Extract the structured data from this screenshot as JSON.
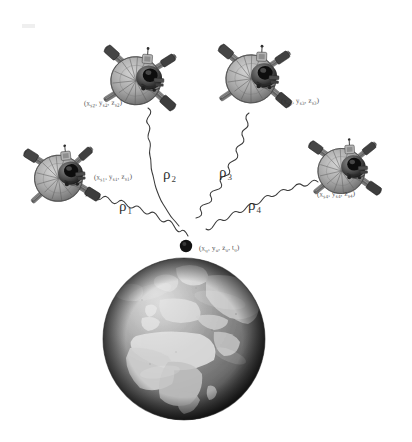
{
  "figure": {
    "background_color": "#ffffff",
    "width": 412,
    "height": 442
  },
  "earth": {
    "name": "Earth globe",
    "description": "Grayscale rendered globe showing Europe and Africa",
    "center_x": 184,
    "center_y": 339,
    "radius": 81,
    "ocean_color": "#8f8f8f",
    "land_color": "#d8d8d8",
    "shadow_color": "#2a2a2a"
  },
  "satellites": [
    {
      "id": "sv1",
      "name": "satellite-1",
      "label": "(xₛ₁, yₛ₁, zₛ₁)",
      "label_parts": [
        "x",
        "s1",
        "y",
        "s1",
        "z",
        "s1"
      ],
      "x": 62,
      "y": 175,
      "label_x": 94,
      "label_y": 173,
      "scale": 0.96,
      "rotation": -6
    },
    {
      "id": "sv2",
      "name": "satellite-2",
      "label": "(xₛ₂, yₛ₂, zₛ₂)",
      "label_parts": [
        "x",
        "s2",
        "y",
        "s2",
        "z",
        "s2"
      ],
      "x": 140,
      "y": 78,
      "label_x": 84,
      "label_y": 99,
      "scale": 1.0,
      "rotation": 4
    },
    {
      "id": "sv3",
      "name": "satellite-3",
      "label": "(xₛ₃, yₛ₃, zₛ₃)",
      "label_parts": [
        "x",
        "s3",
        "y",
        "s3",
        "z",
        "s3"
      ],
      "x": 255,
      "y": 76,
      "label_x": 281,
      "label_y": 97,
      "scale": 1.0,
      "rotation": 2
    },
    {
      "id": "sv4",
      "name": "satellite-4",
      "label": "(xₛ₄, yₛ₄, zₛ₄)",
      "label_parts": [
        "x",
        "s4",
        "y",
        "s4",
        "z",
        "s4"
      ],
      "x": 345,
      "y": 168,
      "label_x": 317,
      "label_y": 190,
      "scale": 0.94,
      "rotation": -3
    }
  ],
  "receiver": {
    "name": "gps-receiver",
    "label": "(xᵤ, yᵤ, zᵤ, tᵤ)",
    "label_parts": [
      "x",
      "u",
      "y",
      "u",
      "z",
      "u",
      "t",
      "u"
    ],
    "x": 186,
    "y": 246,
    "label_x": 199,
    "label_y": 244,
    "dot_radius": 6,
    "dot_color": "#121212"
  },
  "ranges": [
    {
      "id": "rho1",
      "name": "pseudorange-rho-1",
      "symbol": "ρ",
      "subscript": "1",
      "from": "sv1",
      "to": "receiver",
      "label_x": 119,
      "label_y": 198
    },
    {
      "id": "rho2",
      "name": "pseudorange-rho-2",
      "symbol": "ρ",
      "subscript": "2",
      "from": "sv2",
      "to": "receiver",
      "label_x": 163,
      "label_y": 166
    },
    {
      "id": "rho3",
      "name": "pseudorange-rho-3",
      "symbol": "ρ",
      "subscript": "3",
      "from": "sv3",
      "to": "receiver",
      "label_x": 219,
      "label_y": 164
    },
    {
      "id": "rho4",
      "name": "pseudorange-rho-4",
      "symbol": "ρ",
      "subscript": "4",
      "from": "sv4",
      "to": "receiver",
      "label_x": 248,
      "label_y": 197
    }
  ]
}
